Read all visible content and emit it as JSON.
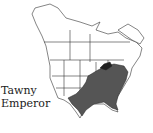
{
  "title": "Tawny Emperor",
  "label_line1": "Tawny",
  "label_line2": "Emperor",
  "map": {
    "region": "North America",
    "range_fill": "#555555",
    "border_color": "#222222",
    "background": "#ffffff"
  }
}
